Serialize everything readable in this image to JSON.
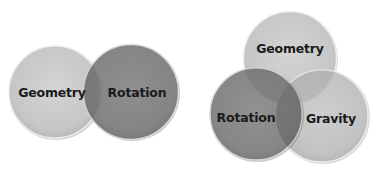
{
  "diagrams": [
    {
      "name": "two-set-venn",
      "sets": [
        {
          "label": "Geometry",
          "fill": "#c9c9c9",
          "opacity": 0.92
        },
        {
          "label": "Rotation",
          "fill": "#808080",
          "opacity": 0.9
        }
      ]
    },
    {
      "name": "three-set-venn",
      "sets": [
        {
          "label": "Geometry",
          "fill": "#cfcfcf",
          "opacity": 0.88
        },
        {
          "label": "Rotation",
          "fill": "#7e7e7e",
          "opacity": 0.9
        },
        {
          "label": "Gravity",
          "fill": "#c4c4c4",
          "opacity": 0.82
        }
      ]
    }
  ],
  "colors": {
    "rim": "#f2f2f2",
    "shadow": "#9a9a9a",
    "text": "#1a1a1a",
    "background": "#ffffff"
  }
}
